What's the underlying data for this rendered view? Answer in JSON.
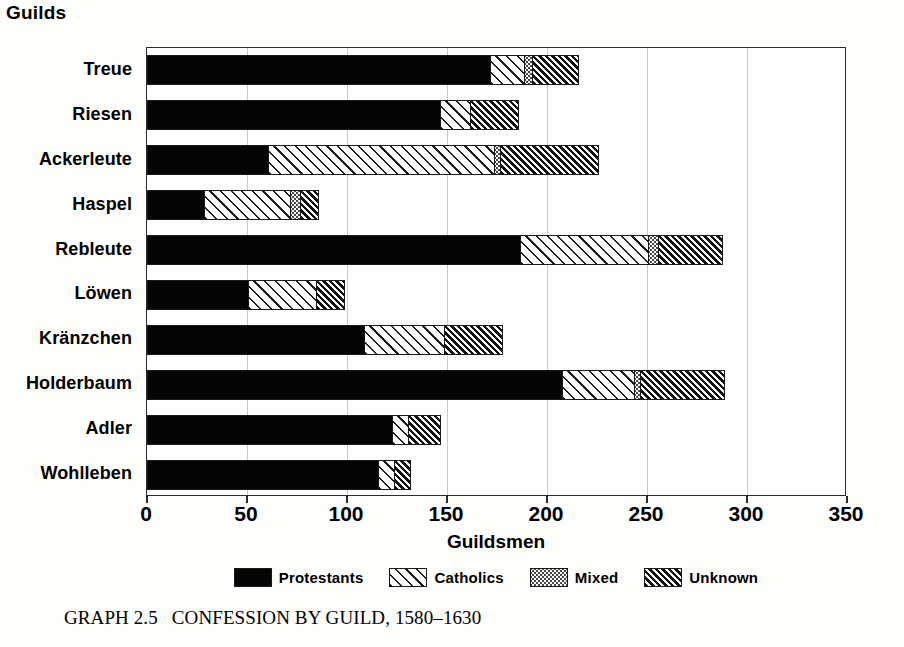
{
  "chart_data": {
    "type": "bar",
    "orientation": "horizontal",
    "stacked": true,
    "xlabel": "Guildsmen",
    "ylabel": "Guilds",
    "xlim": [
      0,
      350
    ],
    "xticks": [
      0,
      50,
      100,
      150,
      200,
      250,
      300,
      350
    ],
    "grid": true,
    "legend_position": "bottom",
    "categories": [
      "Treue",
      "Riesen",
      "Ackerleute",
      "Haspel",
      "Rebleute",
      "Löwen",
      "Kränzchen",
      "Holderbaum",
      "Adler",
      "Wohlleben"
    ],
    "series": [
      {
        "name": "Protestants",
        "pattern": "solid-black",
        "values": [
          171,
          146,
          60,
          28,
          186,
          50,
          108,
          207,
          122,
          115
        ]
      },
      {
        "name": "Catholics",
        "pattern": "diagonal-hatch",
        "values": [
          17,
          15,
          113,
          43,
          64,
          34,
          40,
          36,
          8,
          8
        ]
      },
      {
        "name": "Mixed",
        "pattern": "dotted",
        "values": [
          4,
          0,
          3,
          5,
          5,
          0,
          0,
          3,
          0,
          0
        ]
      },
      {
        "name": "Unknown",
        "pattern": "dense-diagonal-hatch",
        "values": [
          23,
          24,
          49,
          9,
          32,
          14,
          29,
          42,
          16,
          8
        ]
      }
    ],
    "totals": [
      215,
      185,
      225,
      85,
      287,
      98,
      177,
      288,
      146,
      131
    ]
  },
  "axes": {
    "y_axis_title": "Guilds",
    "x_axis_title": "Guildsmen",
    "x_tick_labels": [
      "0",
      "50",
      "100",
      "150",
      "200",
      "250",
      "300",
      "350"
    ],
    "category_labels": [
      "Treue",
      "Riesen",
      "Ackerleute",
      "Haspel",
      "Rebleute",
      "Löwen",
      "Kränzchen",
      "Holderbaum",
      "Adler",
      "Wohlleben"
    ]
  },
  "legend": {
    "items": [
      {
        "label": "Protestants",
        "swatch": "solid-black-swatch"
      },
      {
        "label": "Catholics",
        "swatch": "diagonal-hatch-swatch"
      },
      {
        "label": "Mixed",
        "swatch": "dotted-swatch"
      },
      {
        "label": "Unknown",
        "swatch": "dense-diagonal-hatch-swatch"
      }
    ]
  },
  "caption": {
    "number": "GRAPH 2.5",
    "text": "CONFESSION BY GUILD, 1580–1630"
  },
  "colors": {
    "protestants": "#050505",
    "catholics": "#ffffff",
    "mixed": "#fbfbfb",
    "unknown": "#ffffff",
    "frame": "#2b2b2b",
    "gridline": "#c9c9c9",
    "background": "#fdfdfc"
  }
}
